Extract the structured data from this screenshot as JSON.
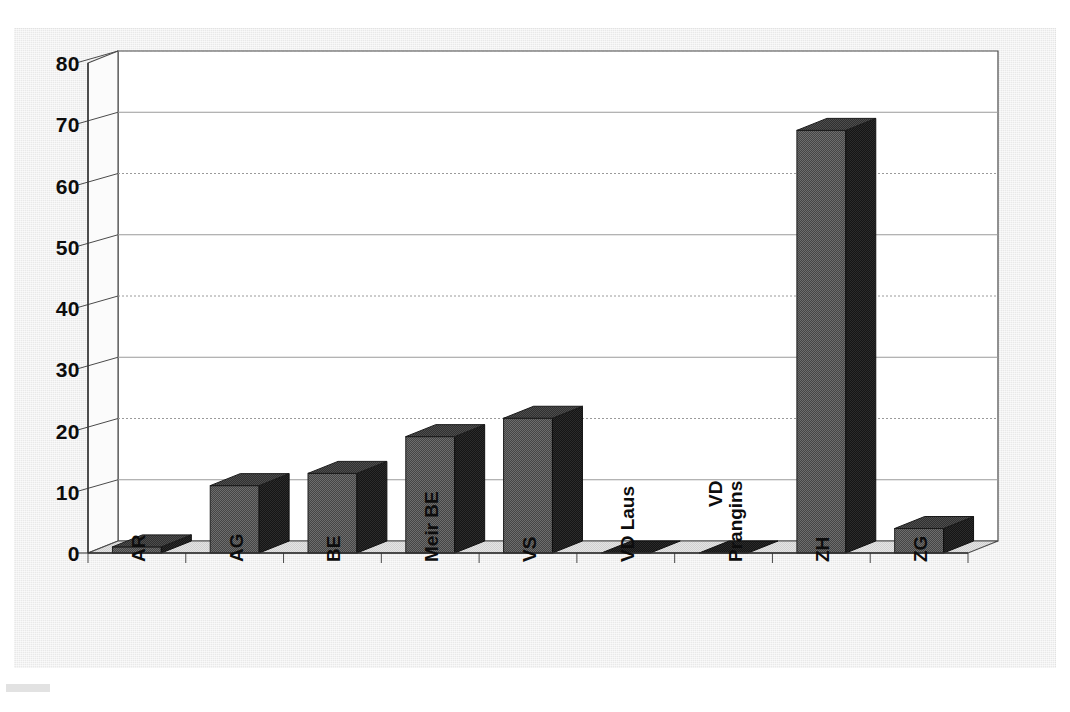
{
  "chart_data": {
    "type": "bar",
    "title": "",
    "subtitle": "",
    "xlabel": "",
    "ylabel": "",
    "categories": [
      "AR",
      "AG",
      "BE",
      "Meir BE",
      "VS",
      "VD Laus",
      "VD Prangins",
      "ZH",
      "ZG"
    ],
    "values": [
      1,
      11,
      13,
      19,
      22,
      0,
      0,
      69,
      4
    ],
    "ylim": [
      0,
      80
    ],
    "yticks": [
      0,
      10,
      20,
      30,
      40,
      50,
      60,
      70,
      80
    ],
    "ytick_labels": [
      "0",
      "10",
      "20",
      "30",
      "40",
      "50",
      "60",
      "70",
      "80"
    ],
    "grid": true,
    "grid_axis": "y",
    "legend": false,
    "legend_position": "none",
    "style": "3d-column",
    "series": [
      {
        "name": "",
        "values": [
          1,
          11,
          13,
          19,
          22,
          0,
          0,
          69,
          4
        ]
      }
    ]
  },
  "axis": {
    "x_label_lines": [
      [
        "AR"
      ],
      [
        "AG"
      ],
      [
        "BE"
      ],
      [
        "Meir BE"
      ],
      [
        "VS"
      ],
      [
        "VD Laus"
      ],
      [
        "VD",
        "Prangins"
      ],
      [
        "ZH"
      ],
      [
        "ZG"
      ]
    ]
  },
  "colors": {
    "page_background": "#ffffff",
    "panel_background": "#e9e9e9",
    "plot_background": "#ffffff",
    "bar_front": "#4f4f4f",
    "bar_side": "#1e1e1e",
    "bar_top": "#3a3a3a",
    "floor": "#dcdcdc",
    "gridline": "#9a9a9a",
    "axis_line": "#4a4a4a",
    "text": "#0d0d0d"
  }
}
